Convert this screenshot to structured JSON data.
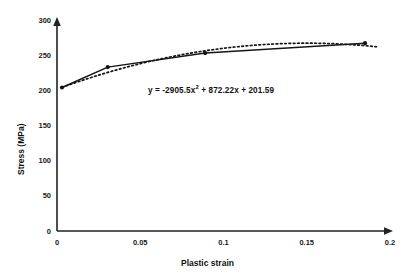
{
  "chart_data": {
    "type": "line",
    "title": "",
    "xlabel": "Plastic strain",
    "ylabel": "Stress  (MPa)",
    "xlim": [
      0,
      0.2
    ],
    "ylim": [
      0,
      300
    ],
    "xticks": [
      "0",
      "0.05",
      "0.1",
      "0.15",
      "0.2"
    ],
    "xtick_values": [
      0,
      0.05,
      0.1,
      0.15,
      0.2
    ],
    "yticks": [
      "0",
      "50",
      "100",
      "150",
      "200",
      "250",
      "300"
    ],
    "ytick_values": [
      0,
      50,
      100,
      150,
      200,
      250,
      300
    ],
    "grid": false,
    "legend": "none",
    "series": [
      {
        "name": "Measured stress-strain",
        "style": "solid-with-markers",
        "color": "#111111",
        "x": [
          0.003,
          0.0305,
          0.089,
          0.185
        ],
        "values": [
          204,
          233,
          253,
          267
        ]
      },
      {
        "name": "Polynomial trendline",
        "style": "dotted",
        "color": "#111111",
        "equation": "y = -2905.5x^2 + 872.22x + 201.59",
        "coefficients": {
          "a": -2905.5,
          "b": 872.22,
          "c": 201.59
        },
        "x_domain": [
          0.003,
          0.192
        ]
      }
    ],
    "annotations": [
      {
        "name": "trendline-equation",
        "text_prefix": "y = -2905.5x",
        "text_exponent": "2",
        "text_suffix": " + 872.22x + 201.59",
        "x": 0.055,
        "y": 212
      }
    ]
  },
  "axes": {
    "x_axis_name": "plastic-strain-axis",
    "y_axis_name": "stress-axis",
    "arrowheads": true
  }
}
